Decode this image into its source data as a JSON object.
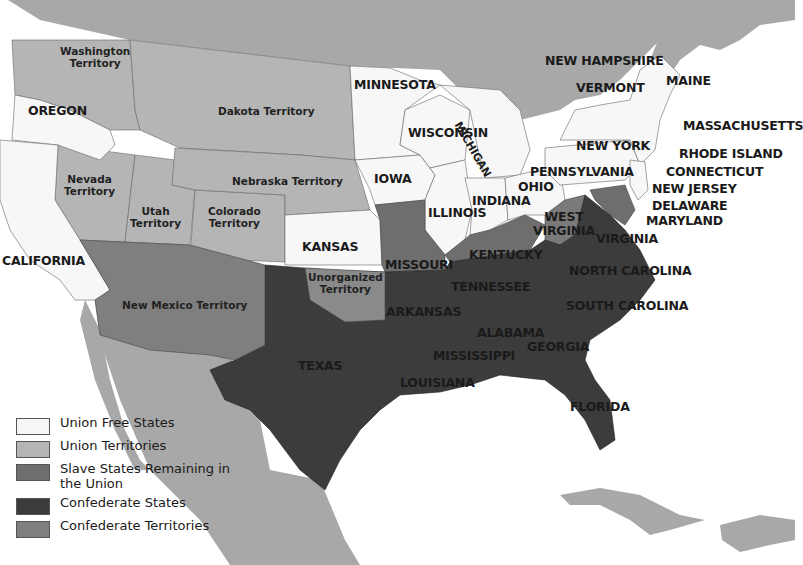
{
  "map": {
    "title": "",
    "colors": {
      "union_free_states": "#f7f7f7",
      "union_territories": "#b5b5b5",
      "slave_states_union": "#6e6e6e",
      "confederate_states": "#3c3c3c",
      "confederate_territories": "#7f7f7f",
      "foreign_land": "#a8a8a8",
      "water": "#ffffff"
    },
    "labels": {
      "washington": "Washington\nTerritory",
      "oregon": "OREGON",
      "california": "CALIFORNIA",
      "nevada": "Nevada\nTerritory",
      "utah": "Utah\nTerritory",
      "colorado": "Colorado\nTerritory",
      "dakota": "Dakota Territory",
      "nebraska": "Nebraska Territory",
      "kansas": "KANSAS",
      "new_mexico": "New Mexico Territory",
      "unorganized": "Unorganized\nTerritory",
      "minnesota": "MINNESOTA",
      "iowa": "IOWA",
      "wisconsin": "WISCONSIN",
      "michigan": "MICHIGAN",
      "illinois": "ILLINOIS",
      "indiana": "INDIANA",
      "ohio": "OHIO",
      "missouri": "MISSOURI",
      "kentucky": "KENTUCKY",
      "west_virginia": "WEST\nVIRGINIA",
      "virginia": "VIRGINIA",
      "tennessee": "TENNESSEE",
      "north_carolina": "NORTH CAROLINA",
      "south_carolina": "SOUTH CAROLINA",
      "arkansas": "ARKANSAS",
      "texas": "TEXAS",
      "louisiana": "LOUISIANA",
      "mississippi": "MISSISSIPPI",
      "alabama": "ALABAMA",
      "georgia": "GEORGIA",
      "florida": "FLORIDA",
      "pennsylvania": "PENNSYLVANIA",
      "new_york": "NEW YORK",
      "vermont": "VERMONT",
      "new_hampshire": "NEW HAMPSHIRE",
      "maine": "MAINE",
      "massachusetts": "MASSACHUSETTS",
      "rhode_island": "RHODE ISLAND",
      "connecticut": "CONNECTICUT",
      "new_jersey": "NEW JERSEY",
      "delaware": "DELAWARE",
      "maryland": "MARYLAND"
    },
    "legend": [
      {
        "label": "Union Free States",
        "color": "#f7f7f7"
      },
      {
        "label": "Union Territories",
        "color": "#b5b5b5"
      },
      {
        "label": "Slave States Remaining in the Union",
        "color": "#6e6e6e"
      },
      {
        "label": "Confederate States",
        "color": "#3c3c3c"
      },
      {
        "label": "Confederate Territories",
        "color": "#7f7f7f"
      }
    ]
  }
}
